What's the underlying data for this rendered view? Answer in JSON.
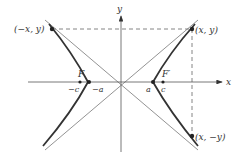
{
  "diagram": {
    "axes": {
      "x_label": "x",
      "y_label": "y"
    },
    "points": {
      "upper_left": "(−x, y)",
      "upper_right": "(x, y)",
      "lower_right": "(x, −y)"
    },
    "foci": {
      "left": "F",
      "right": "F′"
    },
    "axis_marks": {
      "neg_c": "−c",
      "neg_a": "−a",
      "pos_a": "a",
      "pos_c": "c"
    },
    "colors": {
      "curve": "#333333",
      "axis": "#555555",
      "asymptote": "#777777",
      "dashed": "#666666"
    }
  }
}
